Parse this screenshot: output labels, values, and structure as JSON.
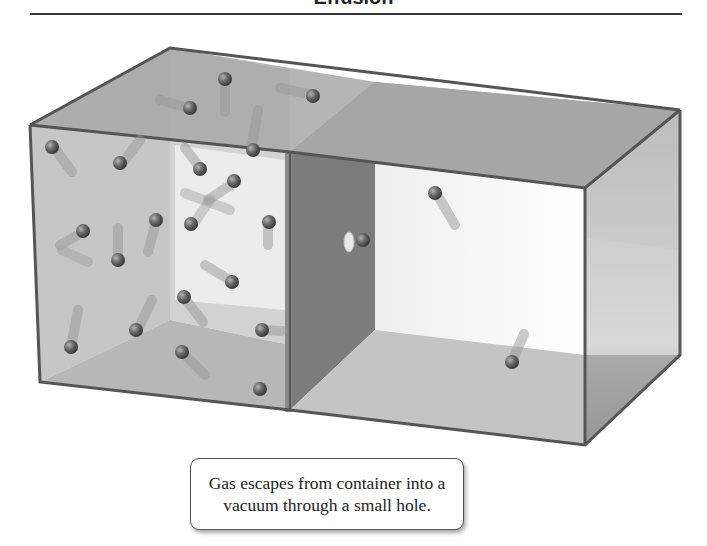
{
  "header": {
    "title": "Effusion"
  },
  "diagram": {
    "left_chamber": {
      "label": "gas-filled container",
      "particle_count": 22
    },
    "right_chamber": {
      "label": "vacuum",
      "particle_count": 2
    },
    "hole": {
      "label": "small hole",
      "particle_passing": true
    }
  },
  "caption": {
    "line1": "Gas escapes from container into a",
    "line2": "vacuum through a small hole."
  },
  "colors": {
    "glass_dark": "#6b6b6b",
    "glass_mid": "#9a9a9a",
    "glass_light": "#d9d9d9",
    "particle": "#555555"
  }
}
